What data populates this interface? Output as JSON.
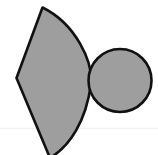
{
  "canvas": {
    "width": 158,
    "height": 155,
    "background_color": "#ffffff",
    "description": "Two overlapping-adjacent geometric shapes: a large gray lens/leaf shape on the left and a smaller gray circle on the right, both with black outlines."
  },
  "style": {
    "fill_color": "#9e9e9e",
    "stroke_color": "#111111",
    "stroke_width": 2.6,
    "faint_line_color": "#f2f2f2"
  },
  "shapes": [
    {
      "name": "leaf-shape",
      "type": "lens",
      "fill": "#9e9e9e",
      "stroke": "#111111",
      "stroke_width": 2.6,
      "path": "M 42.5 7.5 L 16.5 78.0 L 50.0 158.0 C 70.0 146.0 86.0 121.0 91.0 84.0 C 93.0 62.0 76.0 24.0 42.5 7.5 Z",
      "apex_top": [
        42.5,
        7.5
      ],
      "left_vertex": [
        16.5,
        78.0
      ],
      "bottom_tip": [
        50.0,
        158.0
      ],
      "right_extent_x": 92
    },
    {
      "name": "circle-shape",
      "type": "circle",
      "fill": "#9e9e9e",
      "stroke": "#111111",
      "stroke_width": 2.6,
      "center_x": 120.0,
      "center_y": 80.5,
      "radius": 31.5
    }
  ],
  "faint_rule": {
    "name": "faint-horizontal-rule",
    "y": 128.5,
    "x_start": 0,
    "x_end": 158,
    "color": "#f2f2f2"
  }
}
